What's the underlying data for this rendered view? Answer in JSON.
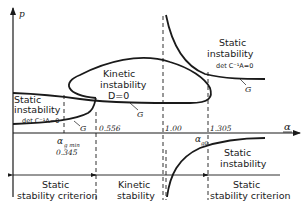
{
  "axes": {
    "y_label": "p",
    "x_label": "α"
  },
  "regions": {
    "static_instability_left": {
      "line1": "Static",
      "line2": "instability",
      "line3": "det C⁻¹A=0"
    },
    "kinetic_instability": {
      "line1": "Kinetic",
      "line2": "instability",
      "line3": "D=0"
    },
    "static_instability_upper_right": {
      "line1": "Static",
      "line2": "instability",
      "line3": "det C⁻¹A=0"
    },
    "static_instability_lower_right": {
      "line1": "Static",
      "line2": "instability"
    }
  },
  "curve_labels": {
    "g_left": "G",
    "g_kinetic": "G",
    "g_right": "G"
  },
  "x_markers": {
    "alpha_g_min_symbol": "α",
    "alpha_g_min_sub": "g min",
    "alpha_g_min_value": "0.345",
    "m1": "0.556",
    "m2": "1.00",
    "m3": "1.305",
    "alpha_g0_symbol": "α",
    "alpha_g0_sub": "g0"
  },
  "bottom_zones": [
    {
      "line1": "Static",
      "line2": "stability criterion"
    },
    {
      "line1": "Kinetic",
      "line2": "stability"
    },
    {
      "line1": "Static",
      "line2": "stability criterion"
    }
  ]
}
